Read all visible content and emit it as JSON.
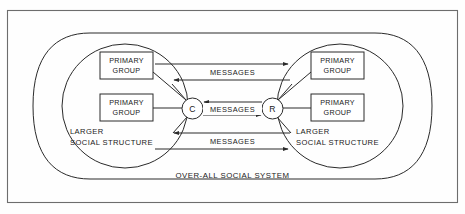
{
  "figure": {
    "type": "communication-model-diagram",
    "title_label": "OVER-ALL SOCIAL SYSTEM",
    "colors": {
      "stroke": "#2a2a2a",
      "frame": "#6d6d6d",
      "background": "#fefefe",
      "text": "#1a1a1a"
    }
  },
  "nodes": {
    "communicator": {
      "label": "C",
      "name": "communicator-node"
    },
    "recipient": {
      "label": "R",
      "name": "recipient-node"
    }
  },
  "groups": {
    "left": [
      {
        "line1": "PRIMARY",
        "line2": "GROUP"
      },
      {
        "line1": "PRIMARY",
        "line2": "GROUP"
      }
    ],
    "right": [
      {
        "line1": "PRIMARY",
        "line2": "GROUP"
      },
      {
        "line1": "PRIMARY",
        "line2": "GROUP"
      }
    ]
  },
  "structures": {
    "left": {
      "line1": "LARGER",
      "line2": "SOCIAL STRUCTURE"
    },
    "right": {
      "line1": "LARGER",
      "line2": "SOCIAL STRUCTURE"
    }
  },
  "channels": [
    {
      "id": "top",
      "label": "MESSAGES",
      "direction": "bidirectional"
    },
    {
      "id": "middle",
      "label": "MESSAGES",
      "direction": "bidirectional"
    },
    {
      "id": "bottom",
      "label": "MESSAGES",
      "direction": "bidirectional"
    }
  ],
  "system": {
    "label": "OVER-ALL SOCIAL SYSTEM"
  }
}
